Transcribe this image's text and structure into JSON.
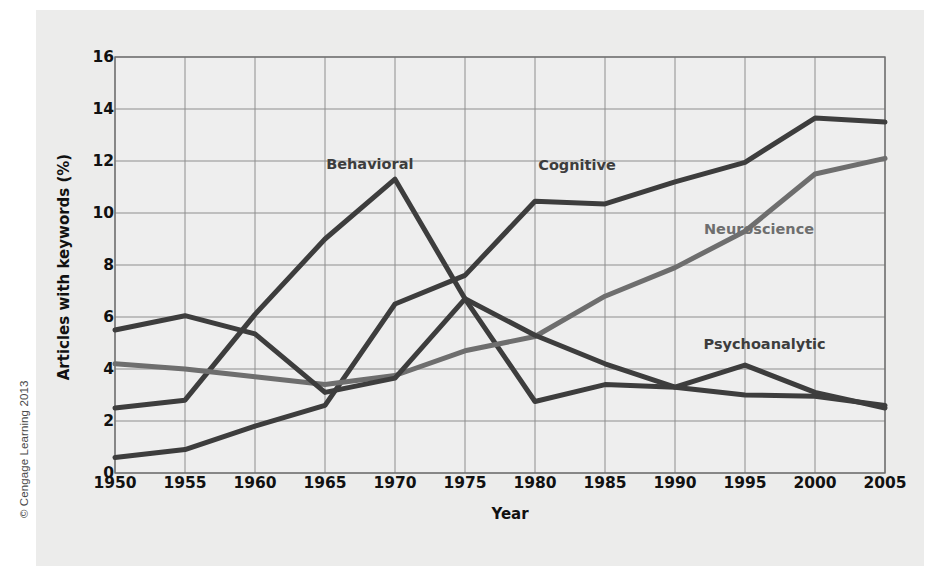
{
  "figure": {
    "copyright": "© Cengage Learning 2013"
  },
  "chart_data": {
    "type": "line",
    "title": "",
    "xlabel": "Year",
    "ylabel": "Articles with keywords (%)",
    "x": [
      1950,
      1955,
      1960,
      1965,
      1970,
      1975,
      1980,
      1985,
      1990,
      1995,
      2000,
      2005
    ],
    "xticks": [
      "1950",
      "1955",
      "1960",
      "1965",
      "1970",
      "1975",
      "1980",
      "1985",
      "1990",
      "1995",
      "2000",
      "2005"
    ],
    "yticks": [
      "0",
      "2",
      "4",
      "6",
      "8",
      "10",
      "12",
      "14",
      "16"
    ],
    "xlim": [
      1950,
      2005
    ],
    "ylim": [
      0,
      16
    ],
    "grid": true,
    "legend": "inline-labels",
    "series": [
      {
        "name": "Behavioral",
        "color": "#3d3d3d",
        "label_x": 1968.2,
        "label_y": 11.9,
        "values": [
          0.6,
          0.9,
          1.8,
          2.6,
          6.5,
          7.6,
          10.45,
          10.35,
          11.2,
          11.95,
          13.65,
          13.5
        ]
      },
      {
        "name": "Cognitive",
        "color": "#3d3d3d",
        "label_x": 1983.0,
        "label_y": 11.85,
        "values": [
          2.5,
          2.8,
          6.1,
          9.0,
          11.3,
          6.7,
          2.75,
          3.4,
          3.3,
          4.15,
          3.1,
          2.5
        ]
      },
      {
        "name": "Neuroscience",
        "color": "#6e6e6e",
        "label_x": 1996.0,
        "label_y": 9.4,
        "values": [
          4.2,
          4.0,
          3.7,
          3.4,
          3.75,
          4.7,
          5.25,
          6.8,
          7.9,
          9.3,
          11.5,
          12.1
        ]
      },
      {
        "name": "Psychoanalytic",
        "color": "#3d3d3d",
        "label_x": 1996.4,
        "label_y": 4.95,
        "values": [
          5.5,
          6.05,
          5.35,
          3.1,
          3.65,
          6.7,
          5.3,
          4.2,
          3.3,
          3.0,
          2.95,
          2.6
        ]
      }
    ]
  }
}
